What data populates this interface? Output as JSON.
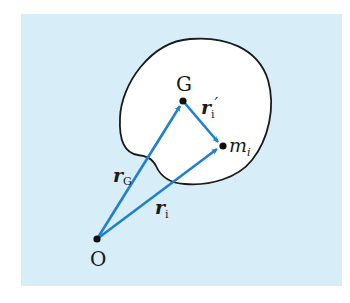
{
  "header_fragment": {
    "text": "··· ··· ··· ··· ·· ·· ···"
  },
  "colors": {
    "background": "#d7edf8",
    "body_fill": "#ffffff",
    "body_outline": "#1a1a1a",
    "arrow": "#1f80d0",
    "point": "#111111"
  },
  "points": {
    "origin": {
      "label": "O",
      "x": 97,
      "y": 239
    },
    "center_of_mass": {
      "label": "G",
      "x": 183,
      "y": 101
    },
    "mass_point": {
      "label": "m",
      "subscript": "i",
      "x": 223,
      "y": 146
    }
  },
  "vectors": {
    "r_G": {
      "symbol": "r",
      "subscript": "G",
      "from": "O",
      "to": "G"
    },
    "r_i": {
      "symbol": "r",
      "subscript": "i",
      "from": "O",
      "to": "m_i"
    },
    "r_i_prime": {
      "symbol": "r",
      "subscript": "i",
      "prime": "′",
      "from": "G",
      "to": "m_i"
    }
  }
}
